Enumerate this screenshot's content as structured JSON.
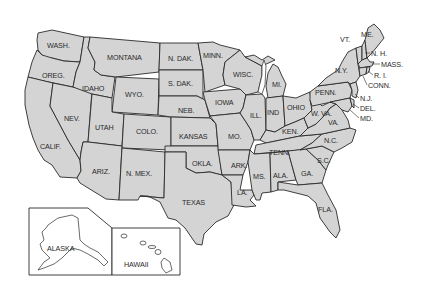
{
  "map": {
    "title": "United States",
    "fill_color": "#d4d4d4",
    "border_color": "#2a2a2a",
    "background": "#ffffff",
    "states": [
      {
        "id": "wa",
        "label": "WASH.",
        "x": 47,
        "y": 42
      },
      {
        "id": "or",
        "label": "OREG.",
        "x": 42,
        "y": 72
      },
      {
        "id": "ca",
        "label": "CALIF.",
        "x": 40,
        "y": 143
      },
      {
        "id": "nv",
        "label": "NEV.",
        "x": 64,
        "y": 115
      },
      {
        "id": "id",
        "label": "IDAHO",
        "x": 82,
        "y": 85
      },
      {
        "id": "mt",
        "label": "MONTANA",
        "x": 107,
        "y": 54
      },
      {
        "id": "wy",
        "label": "WYO.",
        "x": 125,
        "y": 91
      },
      {
        "id": "ut",
        "label": "UTAH",
        "x": 95,
        "y": 124
      },
      {
        "id": "co",
        "label": "COLO.",
        "x": 136,
        "y": 128
      },
      {
        "id": "az",
        "label": "ARIZ.",
        "x": 92,
        "y": 168
      },
      {
        "id": "nm",
        "label": "N. MEX.",
        "x": 126,
        "y": 170
      },
      {
        "id": "nd",
        "label": "N. DAK.",
        "x": 168,
        "y": 55
      },
      {
        "id": "sd",
        "label": "S. DAK.",
        "x": 168,
        "y": 80
      },
      {
        "id": "ne",
        "label": "NEB.",
        "x": 178,
        "y": 107
      },
      {
        "id": "ks",
        "label": "KANSAS",
        "x": 179,
        "y": 133
      },
      {
        "id": "ok",
        "label": "OKLA.",
        "x": 192,
        "y": 160
      },
      {
        "id": "tx",
        "label": "TEXAS",
        "x": 182,
        "y": 199
      },
      {
        "id": "mn",
        "label": "MINN.",
        "x": 203,
        "y": 52
      },
      {
        "id": "ia",
        "label": "IOWA",
        "x": 215,
        "y": 99
      },
      {
        "id": "mo",
        "label": "MO.",
        "x": 228,
        "y": 133
      },
      {
        "id": "ar",
        "label": "ARK.",
        "x": 231,
        "y": 162
      },
      {
        "id": "la",
        "label": "LA.",
        "x": 237,
        "y": 189
      },
      {
        "id": "wi",
        "label": "WISC.",
        "x": 233,
        "y": 71
      },
      {
        "id": "il",
        "label": "ILL.",
        "x": 250,
        "y": 112
      },
      {
        "id": "mi",
        "label": "MI.",
        "x": 272,
        "y": 81
      },
      {
        "id": "in",
        "label": "IND",
        "x": 267,
        "y": 109
      },
      {
        "id": "oh",
        "label": "OHIO",
        "x": 287,
        "y": 104
      },
      {
        "id": "ky",
        "label": "KEN.",
        "x": 282,
        "y": 128
      },
      {
        "id": "tn",
        "label": "TENN.",
        "x": 269,
        "y": 149
      },
      {
        "id": "ms",
        "label": "MS.",
        "x": 253,
        "y": 173
      },
      {
        "id": "al",
        "label": "ALA.",
        "x": 273,
        "y": 172
      },
      {
        "id": "ga",
        "label": "GA.",
        "x": 301,
        "y": 170
      },
      {
        "id": "fl",
        "label": "FLA.",
        "x": 318,
        "y": 206
      },
      {
        "id": "sc",
        "label": "S.C.",
        "x": 317,
        "y": 157
      },
      {
        "id": "nc",
        "label": "N.C.",
        "x": 324,
        "y": 137
      },
      {
        "id": "va",
        "label": "VA.",
        "x": 328,
        "y": 119
      },
      {
        "id": "wv",
        "label": "W. VA.",
        "x": 311,
        "y": 110
      },
      {
        "id": "pa",
        "label": "PENN.",
        "x": 315,
        "y": 89
      },
      {
        "id": "ny",
        "label": "N.Y.",
        "x": 335,
        "y": 67
      },
      {
        "id": "vt",
        "label": "VT.",
        "x": 340,
        "y": 36
      },
      {
        "id": "me",
        "label": "ME.",
        "x": 361,
        "y": 31
      }
    ],
    "callouts": [
      {
        "id": "nh",
        "label": "N. H.",
        "x": 371,
        "y": 50
      },
      {
        "id": "ma",
        "label": "MASS.",
        "x": 381,
        "y": 61
      },
      {
        "id": "ri",
        "label": "R. I.",
        "x": 374,
        "y": 72
      },
      {
        "id": "ct",
        "label": "CONN.",
        "x": 368,
        "y": 82
      },
      {
        "id": "nj",
        "label": "N.J.",
        "x": 360,
        "y": 95
      },
      {
        "id": "de",
        "label": "DEL.",
        "x": 360,
        "y": 105
      },
      {
        "id": "md",
        "label": "MD.",
        "x": 360,
        "y": 115
      }
    ],
    "insets": [
      {
        "id": "ak",
        "label": "ALASKA",
        "x": 47,
        "y": 245
      },
      {
        "id": "hi",
        "label": "HAWAII",
        "x": 124,
        "y": 261
      }
    ]
  }
}
